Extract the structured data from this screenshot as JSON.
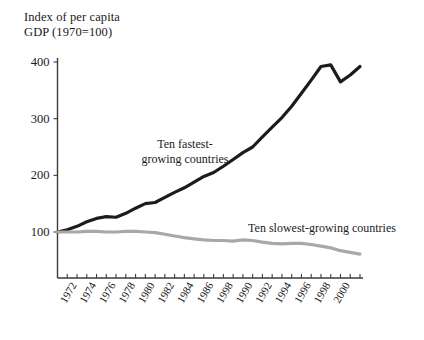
{
  "chart_data": {
    "type": "line",
    "title_line1": "Index of per capita",
    "title_line2": "GDP (1970=100)",
    "xlabel": "",
    "ylabel": "",
    "xlim": [
      1970,
      2001
    ],
    "ylim": [
      0,
      400
    ],
    "grid": false,
    "legend_position": "inline-annotation",
    "yticks": [
      100,
      200,
      300,
      400
    ],
    "ytick_labels": [
      "100",
      "200",
      "300",
      "400"
    ],
    "xticks": [
      1972,
      1974,
      1976,
      1978,
      1980,
      1982,
      1984,
      1986,
      1988,
      1990,
      1992,
      1994,
      1996,
      1998,
      2000
    ],
    "xtick_labels": [
      "1972",
      "1974",
      "1976",
      "1978",
      "1980",
      "1982",
      "1984",
      "1986",
      "1998",
      "1990",
      "1992",
      "1994",
      "1996",
      "1998",
      "2000"
    ],
    "xtick_minor_every_year": true,
    "x": [
      1970,
      1971,
      1972,
      1973,
      1974,
      1975,
      1976,
      1977,
      1978,
      1979,
      1980,
      1981,
      1982,
      1983,
      1984,
      1985,
      1986,
      1987,
      1988,
      1989,
      1990,
      1991,
      1992,
      1993,
      1994,
      1995,
      1996,
      1997,
      1998,
      1999,
      2000,
      2001
    ],
    "series": [
      {
        "name": "Ten fastest-growing countries",
        "color": "#1c1c1c",
        "stroke_width": 3.2,
        "label_line1": "Ten fastest-",
        "label_line2": "growing countries",
        "values": [
          100,
          104,
          110,
          118,
          124,
          127,
          126,
          133,
          142,
          150,
          152,
          161,
          170,
          178,
          188,
          198,
          205,
          216,
          228,
          240,
          250,
          268,
          285,
          302,
          322,
          345,
          368,
          392,
          395,
          365,
          377,
          392
        ]
      },
      {
        "name": "Ten slowest-growing countries",
        "color": "#a8a8a8",
        "stroke_width": 3.2,
        "label": "Ten slowest-growing countries",
        "values": [
          100,
          100,
          100,
          101,
          101,
          100,
          100,
          101,
          101,
          100,
          99,
          96,
          93,
          90,
          88,
          86,
          85,
          85,
          84,
          86,
          85,
          82,
          80,
          79,
          80,
          80,
          78,
          75,
          72,
          67,
          64,
          61
        ]
      }
    ],
    "annotations": [
      {
        "text": "Ten fastest-\ngrowing countries",
        "series": "Ten fastest-growing countries"
      },
      {
        "text": "Ten slowest-growing countries",
        "series": "Ten slowest-growing countries"
      }
    ]
  }
}
